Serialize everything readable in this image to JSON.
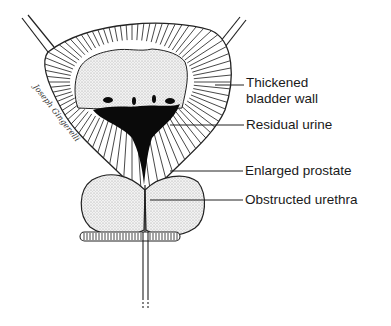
{
  "figure": {
    "signature": "Joseph Gingerelli"
  },
  "labels": [
    {
      "id": "thickened-bladder-wall",
      "line1": "Thickened",
      "line2": "bladder wall"
    },
    {
      "id": "residual-urine",
      "text": "Residual urine"
    },
    {
      "id": "enlarged-prostate",
      "text": "Enlarged prostate"
    },
    {
      "id": "obstructed-urethra",
      "text": "Obstructed urethra"
    }
  ],
  "colors": {
    "stroke": "#222222",
    "stipple": "#e4e4e4",
    "urine": "#0a0a0a",
    "text": "#1a1a1a"
  }
}
